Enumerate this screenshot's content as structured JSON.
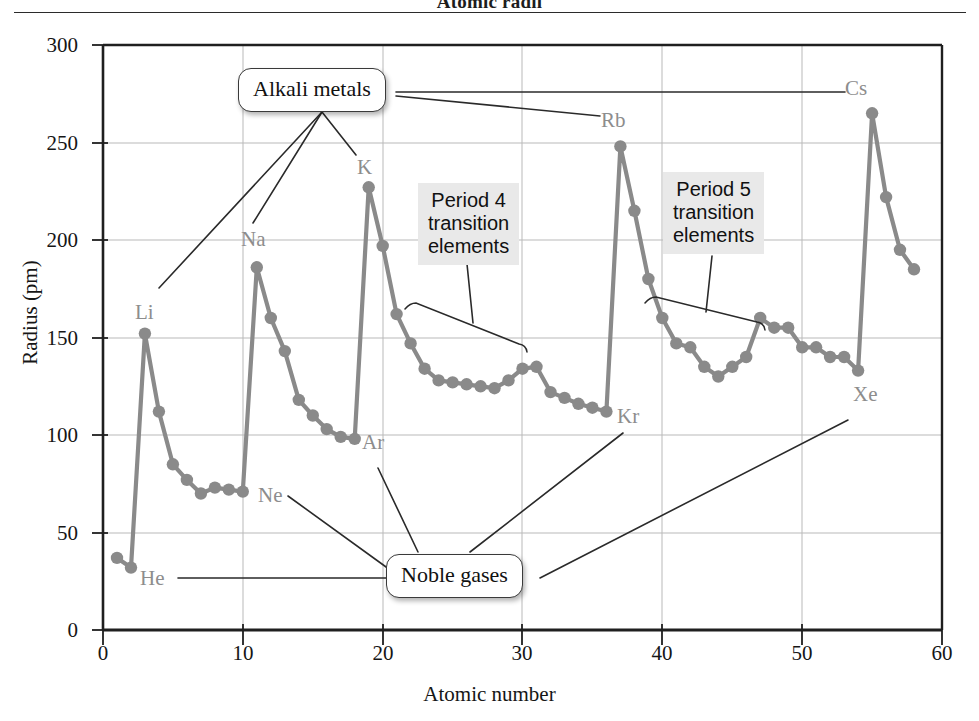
{
  "title": "Atomic radii",
  "axes": {
    "ylabel": "Radius (pm)",
    "xlabel": "Atomic number",
    "yticks": [
      "0",
      "50",
      "100",
      "150",
      "200",
      "250",
      "300"
    ],
    "xticks": [
      "0",
      "10",
      "20",
      "30",
      "40",
      "50",
      "60"
    ]
  },
  "callouts": {
    "alkali": "Alkali metals",
    "noble": "Noble gases",
    "period4_line1": "Period 4",
    "period4_line2": "transition",
    "period4_line3": "elements",
    "period5_line1": "Period 5",
    "period5_line2": "transition",
    "period5_line3": "elements"
  },
  "element_labels": [
    {
      "name": "He",
      "text": "He"
    },
    {
      "name": "Li",
      "text": "Li"
    },
    {
      "name": "Ne",
      "text": "Ne"
    },
    {
      "name": "Na",
      "text": "Na"
    },
    {
      "name": "Ar",
      "text": "Ar"
    },
    {
      "name": "K",
      "text": "K"
    },
    {
      "name": "Kr",
      "text": "Kr"
    },
    {
      "name": "Rb",
      "text": "Rb"
    },
    {
      "name": "Xe",
      "text": "Xe"
    },
    {
      "name": "Cs",
      "text": "Cs"
    }
  ],
  "colors": {
    "series": "#8a8a8a",
    "grid": "#b9b9b9",
    "frame": "#1f1f1f",
    "label_gray": "#8d8d8d",
    "period_box_bg": "#e9e9e9",
    "background": "#ffffff"
  },
  "chart_data": {
    "type": "line",
    "title": "Atomic radii",
    "xlabel": "Atomic number",
    "ylabel": "Radius (pm)",
    "xlim": [
      0,
      60
    ],
    "ylim": [
      0,
      300
    ],
    "xticks": [
      0,
      10,
      20,
      30,
      40,
      50,
      60
    ],
    "yticks": [
      0,
      50,
      100,
      150,
      200,
      250,
      300
    ],
    "grid": true,
    "legend": "none",
    "markers": "filled circles",
    "series": [
      {
        "name": "Atomic radius",
        "x": [
          1,
          2,
          3,
          4,
          5,
          6,
          7,
          8,
          9,
          10,
          11,
          12,
          13,
          14,
          15,
          16,
          17,
          18,
          19,
          20,
          21,
          22,
          23,
          24,
          25,
          26,
          27,
          28,
          29,
          30,
          31,
          32,
          33,
          34,
          35,
          36,
          37,
          38,
          39,
          40,
          41,
          42,
          43,
          44,
          45,
          46,
          47,
          48,
          49,
          50,
          51,
          52,
          53,
          54,
          55,
          56,
          57,
          58
        ],
        "y": [
          37,
          32,
          152,
          112,
          85,
          77,
          70,
          73,
          72,
          71,
          186,
          160,
          143,
          118,
          110,
          103,
          99,
          98,
          227,
          197,
          162,
          147,
          134,
          128,
          127,
          126,
          125,
          124,
          128,
          134,
          135,
          122,
          119,
          116,
          114,
          112,
          248,
          215,
          180,
          160,
          147,
          145,
          135,
          130,
          135,
          140,
          160,
          155,
          155,
          145,
          145,
          140,
          140,
          133,
          265,
          222,
          195,
          185
        ],
        "color": "#8a8a8a"
      }
    ],
    "annotations": [
      {
        "text": "Alkali metals",
        "points_to": [
          "Li",
          "Na",
          "K",
          "Rb",
          "Cs"
        ]
      },
      {
        "text": "Noble gases",
        "points_to": [
          "He",
          "Ne",
          "Ar",
          "Kr",
          "Xe"
        ]
      },
      {
        "text": "Period 4 transition elements",
        "x_range": [
          21,
          30
        ]
      },
      {
        "text": "Period 5 transition elements",
        "x_range": [
          39,
          48
        ]
      }
    ],
    "point_labels": [
      {
        "element": "He",
        "z": 2,
        "radius": 32
      },
      {
        "element": "Li",
        "z": 3,
        "radius": 152
      },
      {
        "element": "Ne",
        "z": 10,
        "radius": 71
      },
      {
        "element": "Na",
        "z": 11,
        "radius": 186
      },
      {
        "element": "Ar",
        "z": 18,
        "radius": 98
      },
      {
        "element": "K",
        "z": 19,
        "radius": 227
      },
      {
        "element": "Kr",
        "z": 36,
        "radius": 112
      },
      {
        "element": "Rb",
        "z": 37,
        "radius": 248
      },
      {
        "element": "Xe",
        "z": 54,
        "radius": 133
      },
      {
        "element": "Cs",
        "z": 55,
        "radius": 265
      }
    ]
  }
}
